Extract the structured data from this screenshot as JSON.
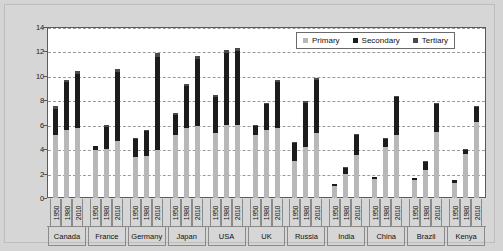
{
  "chart_data": {
    "type": "bar",
    "title": "",
    "subtitle": "",
    "xlabel": "",
    "ylabel": "",
    "ylim": [
      0,
      14
    ],
    "ytick_values": [
      0,
      2,
      4,
      6,
      8,
      10,
      12,
      14
    ],
    "ytick_labels": [
      "0",
      "2",
      "4",
      "6",
      "8",
      "10",
      "12",
      "14"
    ],
    "grid": true,
    "stacked": true,
    "legend_position": "top-right",
    "legend": [
      {
        "name": "Primary",
        "color": "#b8b8b8"
      },
      {
        "name": "Secondary",
        "color": "#1c1c1c"
      },
      {
        "name": "Tertiary",
        "color": "#4a4a4a"
      }
    ],
    "series": [
      {
        "name": "Primary",
        "color": "#b8b8b8"
      },
      {
        "name": "Secondary",
        "color": "#1c1c1c"
      },
      {
        "name": "Tertiary",
        "color": "#4a4a4a"
      }
    ],
    "years": [
      "1950",
      "1980",
      "2010"
    ],
    "countries": [
      "Canada",
      "France",
      "Germany",
      "Japan",
      "USA",
      "UK",
      "Russia",
      "India",
      "China",
      "Brazil",
      "Kenya"
    ],
    "groups": [
      {
        "country": "Canada",
        "bars": [
          {
            "year": "1950",
            "primary": 5.2,
            "secondary": 2.1,
            "tertiary": 0.25,
            "total": 7.55
          },
          {
            "year": "1980",
            "primary": 5.6,
            "secondary": 3.9,
            "tertiary": 0.2,
            "total": 9.7
          },
          {
            "year": "2010",
            "primary": 5.75,
            "secondary": 4.4,
            "tertiary": 0.25,
            "total": 10.4
          }
        ]
      },
      {
        "country": "France",
        "bars": [
          {
            "year": "1950",
            "primary": 3.95,
            "secondary": 0.3,
            "tertiary": 0.0,
            "total": 4.25
          },
          {
            "year": "1980",
            "primary": 4.05,
            "secondary": 1.8,
            "tertiary": 0.1,
            "total": 5.95
          },
          {
            "year": "2010",
            "primary": 4.7,
            "secondary": 5.6,
            "tertiary": 0.25,
            "total": 10.55
          }
        ]
      },
      {
        "country": "Germany",
        "bars": [
          {
            "year": "1950",
            "primary": 3.35,
            "secondary": 1.55,
            "tertiary": 0.05,
            "total": 4.95
          },
          {
            "year": "1980",
            "primary": 3.45,
            "secondary": 2.05,
            "tertiary": 0.1,
            "total": 5.6
          },
          {
            "year": "2010",
            "primary": 3.95,
            "secondary": 7.6,
            "tertiary": 0.3,
            "total": 11.85
          }
        ]
      },
      {
        "country": "Japan",
        "bars": [
          {
            "year": "1950",
            "primary": 5.2,
            "secondary": 1.6,
            "tertiary": 0.15,
            "total": 6.95
          },
          {
            "year": "1980",
            "primary": 5.7,
            "secondary": 3.45,
            "tertiary": 0.2,
            "total": 9.35
          },
          {
            "year": "2010",
            "primary": 5.9,
            "secondary": 5.5,
            "tertiary": 0.25,
            "total": 11.65
          }
        ]
      },
      {
        "country": "USA",
        "bars": [
          {
            "year": "1950",
            "primary": 5.3,
            "secondary": 2.95,
            "tertiary": 0.2,
            "total": 8.45
          },
          {
            "year": "1980",
            "primary": 6.0,
            "secondary": 5.85,
            "tertiary": 0.25,
            "total": 12.1
          },
          {
            "year": "2010",
            "primary": 6.0,
            "secondary": 6.0,
            "tertiary": 0.3,
            "total": 12.3
          }
        ]
      },
      {
        "country": "UK",
        "bars": [
          {
            "year": "1950",
            "primary": 5.2,
            "secondary": 0.7,
            "tertiary": 0.05,
            "total": 5.95
          },
          {
            "year": "1980",
            "primary": 5.6,
            "secondary": 2.1,
            "tertiary": 0.1,
            "total": 7.8
          },
          {
            "year": "2010",
            "primary": 5.75,
            "secondary": 3.75,
            "tertiary": 0.2,
            "total": 9.7
          }
        ]
      },
      {
        "country": "Russia",
        "bars": [
          {
            "year": "1950",
            "primary": 3.05,
            "secondary": 1.45,
            "tertiary": 0.1,
            "total": 4.6
          },
          {
            "year": "1980",
            "primary": 4.2,
            "secondary": 3.6,
            "tertiary": 0.15,
            "total": 7.95
          },
          {
            "year": "2010",
            "primary": 5.35,
            "secondary": 4.3,
            "tertiary": 0.2,
            "total": 9.85
          }
        ]
      },
      {
        "country": "India",
        "bars": [
          {
            "year": "1950",
            "primary": 1.0,
            "secondary": 0.15,
            "tertiary": 0.0,
            "total": 1.15
          },
          {
            "year": "1980",
            "primary": 1.95,
            "secondary": 0.55,
            "tertiary": 0.05,
            "total": 2.55
          },
          {
            "year": "2010",
            "primary": 3.5,
            "secondary": 1.65,
            "tertiary": 0.1,
            "total": 5.25
          }
        ]
      },
      {
        "country": "China",
        "bars": [
          {
            "year": "1950",
            "primary": 1.55,
            "secondary": 0.15,
            "tertiary": 0.0,
            "total": 1.7
          },
          {
            "year": "1980",
            "primary": 4.2,
            "secondary": 0.65,
            "tertiary": 0.05,
            "total": 4.9
          },
          {
            "year": "2010",
            "primary": 5.2,
            "secondary": 3.05,
            "tertiary": 0.1,
            "total": 8.35
          }
        ]
      },
      {
        "country": "Brazil",
        "bars": [
          {
            "year": "1950",
            "primary": 1.5,
            "secondary": 0.15,
            "tertiary": 0.0,
            "total": 1.65
          },
          {
            "year": "1980",
            "primary": 2.3,
            "secondary": 0.65,
            "tertiary": 0.05,
            "total": 3.0
          },
          {
            "year": "2010",
            "primary": 5.4,
            "secondary": 2.3,
            "tertiary": 0.1,
            "total": 7.8
          }
        ]
      },
      {
        "country": "Kenya",
        "bars": [
          {
            "year": "1950",
            "primary": 1.25,
            "secondary": 0.2,
            "tertiary": 0.0,
            "total": 1.45
          },
          {
            "year": "1980",
            "primary": 3.6,
            "secondary": 0.35,
            "tertiary": 0.05,
            "total": 4.0
          },
          {
            "year": "2010",
            "primary": 6.2,
            "secondary": 1.25,
            "tertiary": 0.1,
            "total": 7.55
          }
        ]
      }
    ]
  }
}
